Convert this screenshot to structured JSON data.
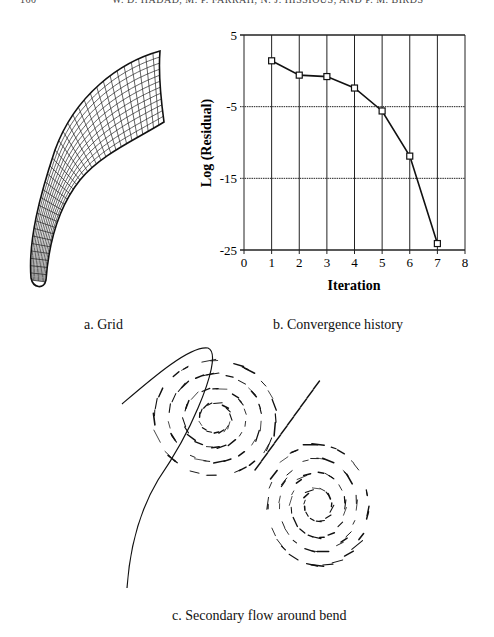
{
  "page": {
    "header_left": "160",
    "header_right": "W. D. HADAD, M. P. FARRAH, N. J. HISSIOUS, AND P. M. BIRDS"
  },
  "figure_a": {
    "caption": "a. Grid",
    "description": "Curved duct computational grid (3D wireframe mesh)"
  },
  "figure_b": {
    "caption": "b. Convergence history"
  },
  "figure_c": {
    "caption": "c. Secondary flow around bend",
    "description": "Velocity vector field showing two counter-rotating vortices with a section outline curve"
  },
  "chart_data": {
    "type": "line",
    "title": "Convergence history",
    "xlabel": "Iteration",
    "ylabel": "Log (Residual)",
    "x": [
      1,
      2,
      3,
      4,
      5,
      6,
      7
    ],
    "series": [
      {
        "name": "Log (Residual)",
        "values": [
          1.4,
          -0.6,
          -0.8,
          -2.4,
          -5.6,
          -11.9,
          -24.1
        ],
        "marker": "square"
      }
    ],
    "xlim": [
      0,
      8
    ],
    "ylim": [
      -25,
      5
    ],
    "xticks": [
      "0",
      "1",
      "2",
      "3",
      "4",
      "5",
      "6",
      "7",
      "8"
    ],
    "yticks": [
      "5",
      "-5",
      "-15",
      "-25"
    ],
    "grid": true,
    "legend": "none"
  }
}
